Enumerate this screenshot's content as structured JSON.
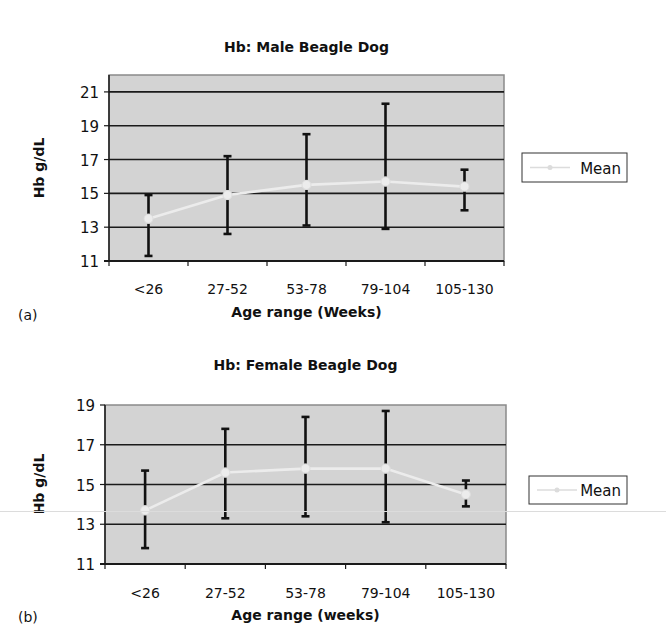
{
  "colors": {
    "plot_bg": "#d3d3d3",
    "plot_border": "#8a8a8a",
    "gridline": "#1a1a1a",
    "errorbar": "#111111",
    "mean_line": "#ececec",
    "legend_border": "#333333",
    "text": "#111111"
  },
  "chart_data": [
    {
      "id": "a",
      "type": "line",
      "panel_label": "(a)",
      "title": "Hb: Male Beagle Dog",
      "xlabel": "Age range (Weeks)",
      "ylabel": "Hb g/dL",
      "categories": [
        "<26",
        "27-52",
        "53-78",
        "79-104",
        "105-130"
      ],
      "ylim": [
        11,
        22
      ],
      "yticks": [
        11,
        13,
        15,
        17,
        19,
        21
      ],
      "grid": true,
      "legend": {
        "position": "right",
        "entries": [
          "Mean"
        ]
      },
      "series": [
        {
          "name": "Mean",
          "values": [
            13.5,
            14.9,
            15.5,
            15.7,
            15.4
          ],
          "error_upper": [
            14.9,
            17.2,
            18.5,
            20.3,
            16.4
          ],
          "error_lower": [
            11.3,
            12.6,
            13.1,
            12.9,
            14.0
          ]
        }
      ]
    },
    {
      "id": "b",
      "type": "line",
      "panel_label": "(b)",
      "title": "Hb: Female Beagle Dog",
      "xlabel": "Age range (weeks)",
      "ylabel": "Hb g/dL",
      "categories": [
        "<26",
        "27-52",
        "53-78",
        "79-104",
        "105-130"
      ],
      "ylim": [
        11,
        19
      ],
      "yticks": [
        11,
        13,
        15,
        17,
        19
      ],
      "grid": true,
      "legend": {
        "position": "right",
        "entries": [
          "Mean"
        ]
      },
      "series": [
        {
          "name": "Mean",
          "values": [
            13.7,
            15.6,
            15.8,
            15.8,
            14.5
          ],
          "error_upper": [
            15.7,
            17.8,
            18.4,
            18.7,
            15.2
          ],
          "error_lower": [
            11.8,
            13.3,
            13.4,
            13.1,
            13.9
          ]
        }
      ]
    }
  ],
  "layout": {
    "a": {
      "plot_left": 109,
      "plot_right": 504,
      "plot_top": 75,
      "y_at_min": 261,
      "y_at_max": 75,
      "title_y": 52,
      "xlabel_y": 294,
      "xtitle_y": 317,
      "legend_box": [
        522,
        153,
        105,
        29
      ],
      "panel_xy": [
        18,
        320
      ],
      "ylabel_x": 44,
      "ylabel_y": 168
    },
    "b": {
      "plot_left": 105,
      "plot_right": 506,
      "plot_top": 75,
      "y_at_min": 234,
      "y_at_max": 75,
      "title_y": 40,
      "xlabel_y": 268,
      "xtitle_y": 290,
      "legend_box": [
        529,
        146,
        98,
        28
      ],
      "panel_xy": [
        18,
        292
      ],
      "ylabel_x": 44,
      "ylabel_y": 154
    }
  }
}
